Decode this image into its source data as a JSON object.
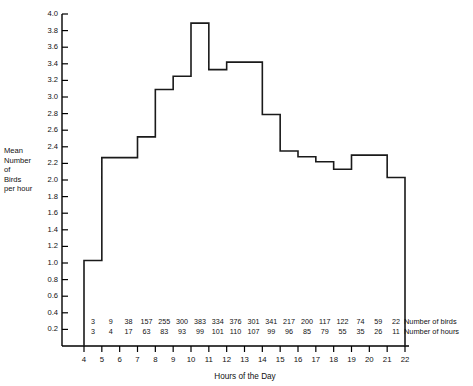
{
  "chart_data": {
    "type": "line",
    "subtype": "step",
    "title": "",
    "xlabel": "Hours of the Day",
    "ylabel": "Mean Number of Birds per hour",
    "ylabel_lines": [
      "Mean",
      "Number",
      "of",
      "Birds",
      "per hour"
    ],
    "xlim": [
      4,
      22
    ],
    "ylim": [
      0.0,
      4.0
    ],
    "ytick_step": 0.2,
    "grid": false,
    "legend": null,
    "xticks": [
      4,
      5,
      6,
      7,
      8,
      9,
      10,
      11,
      12,
      13,
      14,
      15,
      16,
      17,
      18,
      19,
      20,
      21,
      22
    ],
    "yticks": [
      "0.2",
      "0.4",
      "0.6",
      "0.8",
      "1.0",
      "1.2",
      "1.4",
      "1.6",
      "1.8",
      "2.0",
      "2.2",
      "2.4",
      "2.6",
      "2.8",
      "3.0",
      "3.2",
      "3.4",
      "3.6",
      "3.8",
      "4.0"
    ],
    "x_intervals": [
      "4-5",
      "5-6",
      "6-7",
      "7-8",
      "8-9",
      "9-10",
      "10-11",
      "11-12",
      "12-13",
      "13-14",
      "14-15",
      "15-16",
      "16-17",
      "17-18",
      "18-19",
      "19-20",
      "20-21",
      "21-22"
    ],
    "values": [
      1.03,
      2.27,
      2.27,
      2.52,
      3.09,
      3.25,
      3.89,
      3.33,
      3.42,
      3.42,
      2.79,
      2.35,
      2.28,
      2.22,
      2.13,
      2.3,
      2.3,
      2.03
    ],
    "annotation_rows": [
      {
        "label": "Number of birds",
        "values": [
          3,
          9,
          38,
          157,
          255,
          300,
          383,
          334,
          376,
          301,
          341,
          217,
          200,
          117,
          122,
          74,
          59,
          22
        ]
      },
      {
        "label": "Number of hours",
        "values": [
          3,
          4,
          17,
          63,
          83,
          93,
          99,
          101,
          110,
          107,
          99,
          96,
          85,
          79,
          55,
          35,
          26,
          11
        ]
      }
    ]
  },
  "axis_titles": {
    "x": "Hours of the Day"
  },
  "side_notes": {
    "birds": "Number of birds",
    "hours": "Number of hours"
  }
}
